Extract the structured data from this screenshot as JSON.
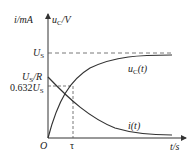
{
  "diagram": {
    "y_axis_labels": {
      "left": "i/mA",
      "right": "u_C/V"
    },
    "x_axis_label": "t/s",
    "origin": "O",
    "y_ticks": {
      "us": "U_S",
      "us_over_r": "U_S/R",
      "pct": "0.632U_S"
    },
    "x_ticks": {
      "tau": "τ"
    },
    "curves": {
      "uc": "u_C(t)",
      "i": "i(t)"
    },
    "colors": {
      "line": "#333333",
      "dash": "#555555"
    }
  }
}
